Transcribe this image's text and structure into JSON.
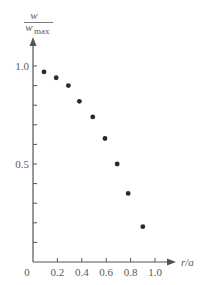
{
  "chart_data": {
    "type": "scatter",
    "title": "",
    "xlabel": "r/a",
    "ylabel": "w / w_max",
    "ylabel_parts": {
      "numerator": "w",
      "denominator": "w",
      "denominator_sub": "max"
    },
    "xlim": [
      0,
      1.0
    ],
    "ylim": [
      0,
      1.0
    ],
    "x_ticks": [
      0.2,
      0.4,
      0.6,
      0.8,
      1.0
    ],
    "x_tick_labels": [
      "0",
      "0.2",
      "0.4",
      "0.6",
      "0.8",
      "1.0"
    ],
    "y_ticks": [
      0.1,
      0.2,
      0.3,
      0.4,
      0.5,
      0.6,
      0.7,
      0.8,
      0.9,
      1.0
    ],
    "y_tick_labels": {
      "0.5": "0.5",
      "1.0": "1.0"
    },
    "grid": false,
    "legend": null,
    "series": [
      {
        "name": "w/w_max",
        "x": [
          0.09,
          0.19,
          0.29,
          0.38,
          0.49,
          0.59,
          0.69,
          0.78,
          0.9
        ],
        "y": [
          0.97,
          0.94,
          0.9,
          0.82,
          0.74,
          0.63,
          0.5,
          0.35,
          0.18
        ]
      }
    ],
    "colors": {
      "axis": "#555555",
      "text": "#5a5a5a",
      "point": "#2a2a2a"
    }
  }
}
